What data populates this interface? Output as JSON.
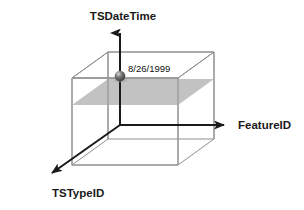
{
  "figure": {
    "type": "3d-cube-diagram",
    "title_visible": false,
    "background_color": "#ffffff",
    "axes": [
      {
        "id": "tsdatetime",
        "label": "TSDateTime",
        "direction": "up",
        "color": "#1a1a1a",
        "origin": [
          120,
          125
        ],
        "tip": [
          120,
          27
        ]
      },
      {
        "id": "featureid",
        "label": "FeatureID",
        "direction": "right",
        "color": "#1a1a1a",
        "origin": [
          120,
          125
        ],
        "tip": [
          232,
          125
        ]
      },
      {
        "id": "tstypeid",
        "label": "TSTypeID",
        "direction": "down-left",
        "color": "#1a1a1a",
        "origin": [
          120,
          125
        ],
        "tip": [
          45,
          178
        ]
      }
    ],
    "cube": {
      "edge_color": "#8c8c8c",
      "face_color": "none",
      "front_top_left": [
        72,
        78
      ],
      "front_top_right": [
        178,
        78
      ],
      "front_bottom_left": [
        72,
        165
      ],
      "front_bottom_right": [
        178,
        165
      ],
      "depth_dx": 36,
      "depth_dy": -26
    },
    "slice_plane": {
      "name": "time-slice-plane",
      "fill_color": "#bfbfbf",
      "opacity": 0.95,
      "description": "horizontal gray slice plane through the cube"
    },
    "data_point": {
      "name": "time-slice-marker",
      "label": "8/26/1999",
      "sphere_color": "#5a5a5a",
      "highlight_color": "#d8d8d8",
      "center": [
        120,
        76
      ],
      "radius": 5.2,
      "label_position": [
        127,
        69
      ]
    }
  }
}
